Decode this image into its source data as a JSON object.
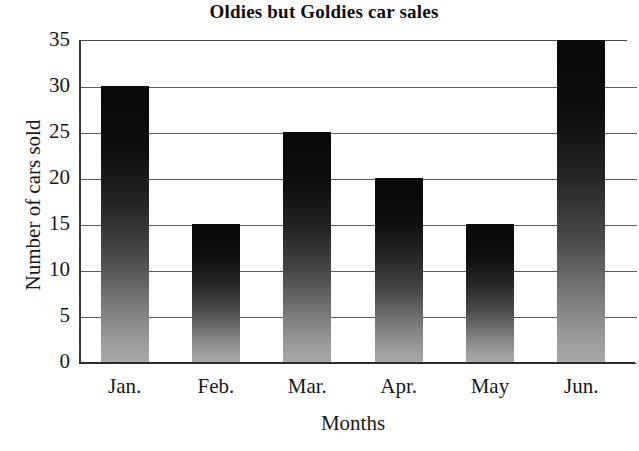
{
  "chart_data": {
    "type": "bar",
    "title": "Oldies but Goldies car sales",
    "xlabel": "Months",
    "ylabel": "Number of cars sold",
    "categories": [
      "Jan.",
      "Feb.",
      "Mar.",
      "Apr.",
      "May",
      "Jun."
    ],
    "values": [
      30,
      15,
      25,
      20,
      15,
      35
    ],
    "ylim": [
      0,
      35
    ],
    "yticks": [
      0,
      5,
      10,
      15,
      20,
      25,
      30,
      35
    ],
    "ytick_labels": [
      "0",
      "5",
      "10",
      "15",
      "20",
      "25",
      "30",
      "35"
    ],
    "grid": true,
    "grid_axis": "y",
    "legend": false,
    "legend_position": "none",
    "bar_fill": "vertical-gradient-black-to-gray",
    "bar_color_top": "#080808",
    "bar_color_bottom": "#a8a8a8",
    "axis_color": "#2b2b2b",
    "grid_color": "#5a5a5a",
    "background": "#ffffff",
    "text_color": "#171717"
  }
}
